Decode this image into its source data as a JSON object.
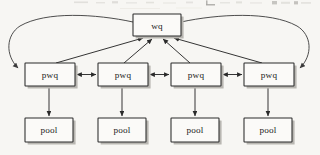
{
  "figure": {
    "background_color": "#f7f6f3",
    "stroke_color": "#2a2a2a",
    "box_fill": "#fbfaf8",
    "shadow_color": "#b9b7b2",
    "top_artifact_label": "cut-off-text-remnant"
  },
  "nodes": {
    "wq": {
      "label": "wq",
      "x": 133,
      "y": 14,
      "w": 48,
      "h": 22
    },
    "pwq": [
      {
        "label": "pwq",
        "x": 25,
        "y": 63,
        "w": 50,
        "h": 23
      },
      {
        "label": "pwq",
        "x": 98,
        "y": 63,
        "w": 50,
        "h": 23
      },
      {
        "label": "pwq",
        "x": 171,
        "y": 63,
        "w": 50,
        "h": 23
      },
      {
        "label": "pwq",
        "x": 244,
        "y": 63,
        "w": 50,
        "h": 23
      }
    ],
    "pool": [
      {
        "label": "pool",
        "x": 25,
        "y": 118,
        "w": 48,
        "h": 24
      },
      {
        "label": "pool",
        "x": 98,
        "y": 118,
        "w": 48,
        "h": 24
      },
      {
        "label": "pool",
        "x": 171,
        "y": 118,
        "w": 48,
        "h": 24
      },
      {
        "label": "pool",
        "x": 244,
        "y": 118,
        "w": 48,
        "h": 24
      }
    ]
  },
  "edges": {
    "pwq_to_wq": [
      {
        "from": "pwq-1",
        "to": "wq",
        "style": "diagonal-arrow",
        "direction": "up"
      },
      {
        "from": "pwq-2",
        "to": "wq",
        "style": "diagonal-arrow",
        "direction": "up"
      },
      {
        "from": "pwq-3",
        "to": "wq",
        "style": "diagonal-arrow",
        "direction": "up"
      },
      {
        "from": "pwq-4",
        "to": "wq",
        "style": "diagonal-arrow",
        "direction": "up"
      }
    ],
    "pwq_to_pwq": [
      {
        "from": "pwq-1",
        "to": "pwq-2",
        "style": "double-arrow",
        "direction": "bidirectional"
      },
      {
        "from": "pwq-2",
        "to": "pwq-3",
        "style": "double-arrow",
        "direction": "bidirectional"
      },
      {
        "from": "pwq-3",
        "to": "pwq-4",
        "style": "double-arrow",
        "direction": "bidirectional"
      }
    ],
    "pwq_to_pool": [
      {
        "from": "pwq-1",
        "to": "pool-1",
        "style": "vertical-arrow",
        "direction": "down"
      },
      {
        "from": "pwq-2",
        "to": "pool-2",
        "style": "vertical-arrow",
        "direction": "down"
      },
      {
        "from": "pwq-3",
        "to": "pool-3",
        "style": "vertical-arrow",
        "direction": "down"
      },
      {
        "from": "pwq-4",
        "to": "pool-4",
        "style": "vertical-arrow",
        "direction": "down"
      }
    ],
    "wq_to_pwq_arcs": [
      {
        "from": "wq",
        "to": "pwq-1",
        "style": "curved-arc",
        "direction": "left-sweep"
      },
      {
        "from": "wq",
        "to": "pwq-4",
        "style": "curved-arc",
        "direction": "right-sweep"
      }
    ]
  }
}
